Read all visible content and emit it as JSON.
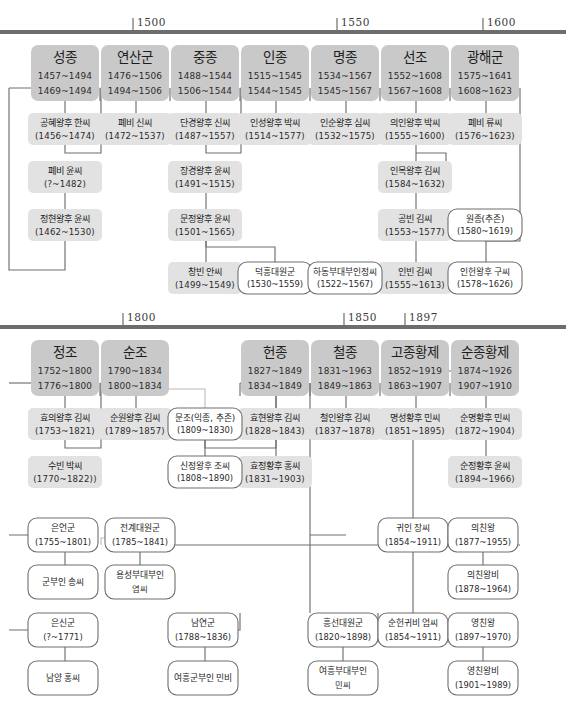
{
  "figure": {
    "colors": {
      "king_box": "#c9c9c9",
      "consort_box": "#e2e2e2",
      "outline_box": "#ffffff",
      "line": "#6f6f6f",
      "line_light": "#b9b9b9",
      "timeline": "#6d6d6d"
    }
  },
  "timelines": [
    {
      "id": "timeline-top",
      "y": 30,
      "x1": 0,
      "x2": 566,
      "ticks": [
        {
          "label": "1500",
          "x": 133
        },
        {
          "label": "1550",
          "x": 337
        },
        {
          "label": "1600",
          "x": 483
        }
      ]
    },
    {
      "id": "timeline-bottom",
      "y": 325,
      "x1": 0,
      "x2": 566,
      "ticks": [
        {
          "label": "1800",
          "x": 123
        },
        {
          "label": "1850",
          "x": 344
        },
        {
          "label": "1897",
          "x": 405
        }
      ]
    }
  ],
  "kings_top": [
    {
      "name": "성종",
      "life": "1457~1494",
      "reign": "1469~1494",
      "x": 31,
      "y": 45
    },
    {
      "name": "연산군",
      "life": "1476~1506",
      "reign": "1494~1506",
      "x": 101,
      "y": 45
    },
    {
      "name": "중종",
      "life": "1488~1544",
      "reign": "1506~1544",
      "x": 171,
      "y": 45
    },
    {
      "name": "인종",
      "life": "1515~1545",
      "reign": "1544~1545",
      "x": 241,
      "y": 45
    },
    {
      "name": "명종",
      "life": "1534~1567",
      "reign": "1545~1567",
      "x": 311,
      "y": 45
    },
    {
      "name": "선조",
      "life": "1552~1608",
      "reign": "1567~1608",
      "x": 381,
      "y": 45
    },
    {
      "name": "광해군",
      "life": "1575~1641",
      "reign": "1608~1623",
      "x": 451,
      "y": 45
    }
  ],
  "kings_bottom": [
    {
      "name": "정조",
      "life": "1752~1800",
      "reign": "1776~1800",
      "x": 31,
      "y": 340
    },
    {
      "name": "순조",
      "life": "1790~1834",
      "reign": "1800~1834",
      "x": 101,
      "y": 340
    },
    {
      "name": "헌종",
      "life": "1827~1849",
      "reign": "1834~1849",
      "x": 241,
      "y": 340
    },
    {
      "name": "철종",
      "life": "1831~1963",
      "reign": "1849~1863",
      "x": 311,
      "y": 340
    },
    {
      "name": "고종황제",
      "life": "1852~1919",
      "reign": "1863~1907",
      "x": 381,
      "y": 340
    },
    {
      "name": "순종황제",
      "life": "1874~1926",
      "reign": "1907~1910",
      "x": 451,
      "y": 340
    }
  ],
  "consorts_top": [
    {
      "name": "공혜왕후 한씨",
      "date": "(1456~1474)",
      "x": 28,
      "y": 113
    },
    {
      "name": "폐비 윤씨",
      "date": "(?~1482)",
      "x": 28,
      "y": 161
    },
    {
      "name": "정현왕후 윤씨",
      "date": "(1462~1530)",
      "x": 28,
      "y": 209
    },
    {
      "name": "폐비 신씨",
      "date": "(1472~1537)",
      "x": 98,
      "y": 113
    },
    {
      "name": "단경왕후 신씨",
      "date": "(1487~1557)",
      "x": 168,
      "y": 113
    },
    {
      "name": "장경왕후 윤씨",
      "date": "(1491~1515)",
      "x": 168,
      "y": 161
    },
    {
      "name": "문정왕후 윤씨",
      "date": "(1501~1565)",
      "x": 168,
      "y": 209
    },
    {
      "name": "창빈 안씨",
      "date": "(1499~1549)",
      "x": 168,
      "y": 262
    },
    {
      "name": "인성왕후 박씨",
      "date": "(1514~1577)",
      "x": 238,
      "y": 113
    },
    {
      "name": "인순왕후 심씨",
      "date": "(1532~1575)",
      "x": 308,
      "y": 113
    },
    {
      "name": "의인왕후 박씨",
      "date": "(1555~1600)",
      "x": 378,
      "y": 113
    },
    {
      "name": "인목왕후 김씨",
      "date": "(1584~1632)",
      "x": 378,
      "y": 161
    },
    {
      "name": "공빈 김씨",
      "date": "(1553~1577)",
      "x": 378,
      "y": 209
    },
    {
      "name": "인빈 김씨",
      "date": "(1555~1613)",
      "x": 378,
      "y": 262
    },
    {
      "name": "폐비 류씨",
      "date": "(1576~1623)",
      "x": 448,
      "y": 113
    }
  ],
  "outline_top": [
    {
      "name": "덕흥대원군",
      "date": "(1530~1559)",
      "x": 238,
      "y": 262,
      "w": 74,
      "h": 32
    },
    {
      "name": "하동부대부인정씨",
      "date": "(1522~1567)",
      "x": 308,
      "y": 262,
      "w": 74,
      "h": 32
    },
    {
      "name": "원종(추존)",
      "date": "(1580~1619)",
      "x": 448,
      "y": 209,
      "w": 74,
      "h": 32
    },
    {
      "name": "인헌왕후 구씨",
      "date": "(1578~1626)",
      "x": 448,
      "y": 262,
      "w": 74,
      "h": 32
    }
  ],
  "consorts_bottom": [
    {
      "name": "효의왕후 김씨",
      "date": "(1753~1821)",
      "x": 28,
      "y": 408
    },
    {
      "name": "수빈 박씨",
      "date": "(1770~1822))",
      "x": 28,
      "y": 456
    },
    {
      "name": "순원왕후 김씨",
      "date": "(1789~1857)",
      "x": 98,
      "y": 408
    },
    {
      "name": "효현왕후 김씨",
      "date": "(1828~1843)",
      "x": 238,
      "y": 408
    },
    {
      "name": "효정황후 홍씨",
      "date": "(1831~1903)",
      "x": 238,
      "y": 456
    },
    {
      "name": "철인왕후 김씨",
      "date": "(1837~1878)",
      "x": 308,
      "y": 408
    },
    {
      "name": "명성황후 민씨",
      "date": "(1851~1895)",
      "x": 378,
      "y": 408
    },
    {
      "name": "순명황후 민씨",
      "date": "(1872~1904)",
      "x": 448,
      "y": 408
    },
    {
      "name": "순정황후 윤씨",
      "date": "(1894~1966)",
      "x": 448,
      "y": 456
    }
  ],
  "outline_bottom": [
    {
      "name": "문조(익종, 추존)",
      "date": "(1809~1830)",
      "x": 168,
      "y": 408,
      "w": 74,
      "h": 32
    },
    {
      "name": "신정왕후 조씨",
      "date": "(1808~1890)",
      "x": 168,
      "y": 456,
      "w": 74,
      "h": 32
    },
    {
      "name": "은언군",
      "date": "(1755~1801)",
      "x": 28,
      "y": 518,
      "w": 70,
      "h": 34
    },
    {
      "name": "전계대원군",
      "date": "(1785~1841)",
      "x": 105,
      "y": 518,
      "w": 70,
      "h": 34
    },
    {
      "name": "군부인 송씨",
      "date": "",
      "x": 28,
      "y": 565,
      "w": 70,
      "h": 34
    },
    {
      "name": "용성부대부인",
      "date": "염씨",
      "x": 105,
      "y": 565,
      "w": 70,
      "h": 34
    },
    {
      "name": "은신군",
      "date": "(?~1771)",
      "x": 28,
      "y": 613,
      "w": 70,
      "h": 34
    },
    {
      "name": "남연군",
      "date": "(1788~1836)",
      "x": 168,
      "y": 613,
      "w": 70,
      "h": 34
    },
    {
      "name": "남양 홍씨",
      "date": "",
      "x": 28,
      "y": 661,
      "w": 70,
      "h": 34
    },
    {
      "name": "여흥군부인 민비",
      "date": "",
      "x": 168,
      "y": 661,
      "w": 70,
      "h": 34
    },
    {
      "name": "흥선대원군",
      "date": "(1820~1898)",
      "x": 308,
      "y": 613,
      "w": 70,
      "h": 34
    },
    {
      "name": "여흥부대부인",
      "date": "민씨",
      "x": 308,
      "y": 661,
      "w": 70,
      "h": 34
    },
    {
      "name": "귀인 장씨",
      "date": "(1854~1911)",
      "x": 378,
      "y": 518,
      "w": 70,
      "h": 34
    },
    {
      "name": "순헌귀비 엄씨",
      "date": "(1854~1911)",
      "x": 378,
      "y": 613,
      "w": 70,
      "h": 34
    },
    {
      "name": "의친왕",
      "date": "(1877~1955)",
      "x": 448,
      "y": 518,
      "w": 70,
      "h": 34
    },
    {
      "name": "의친왕비",
      "date": "(1878~1964)",
      "x": 448,
      "y": 565,
      "w": 70,
      "h": 34
    },
    {
      "name": "영친왕",
      "date": "(1897~1970)",
      "x": 448,
      "y": 613,
      "w": 70,
      "h": 34
    },
    {
      "name": "영친왕비",
      "date": "(1901~1989)",
      "x": 448,
      "y": 661,
      "w": 70,
      "h": 34
    }
  ],
  "edges": {
    "solid": [
      "M65,101 L65,113",
      "M65,145 L65,153 L101,153 L101,88 L136,88 L136,101",
      "M65,193 L65,209",
      "M9,88 L65,88",
      "M9,88 L9,270 L65,270 L65,241",
      "M136,101 L136,113",
      "M206,101 L206,113",
      "M206,145 L206,153 L241,153 L241,88 L276,88 L276,101",
      "M206,193 L206,209",
      "M206,241 L206,255 L206,262",
      "M276,101 L276,113",
      "M346,101 L346,113",
      "M206,241 L206,247 L275,247 L275,262",
      "M416,101 L416,113",
      "M416,145 L416,161",
      "M416,193 L416,209",
      "M416,241 L416,262",
      "M486,101 L486,113",
      "M275,278 L345,278",
      "M486,209 L486,262",
      "M310,88 L310,101",
      "M380,88 L380,101",
      "M450,88 L450,101",
      "M100,88 L100,101",
      "M170,88 L170,101",
      "M240,88 L240,101",
      "M520,88 L520,241 L485,241",
      "M446,193 L446,161 L446,153 L416,153",
      "M65,396 L65,408",
      "M65,440 L65,448 L101,448 L101,383 L136,383 L136,396",
      "M136,396 L136,408",
      "M276,396 L276,408",
      "M276,440 L276,456",
      "M346,396 L346,408",
      "M416,396 L416,408",
      "M486,396 L486,408",
      "M486,440 L486,456",
      "M416,379 L416,371 L486,371 L486,383",
      "M310,383 L310,396",
      "M380,383 L380,396",
      "M450,383 L450,396",
      "M100,383 L100,396",
      "M240,383 L240,396",
      "M9,383 L31,383",
      "M205,440 L205,448 L276,448 L276,383 L240,383",
      "M205,440 L205,456",
      "M65,552 L65,565",
      "M140,552 L140,565",
      "M65,647 L65,661",
      "M205,647 L205,661",
      "M343,647 L343,661",
      "M140,552 L140,545 L520,545",
      "M413,440 L413,518",
      "M413,552 L413,613",
      "M483,552 L483,565",
      "M483,647 L483,661",
      "M310,383 L310,535 L310,613",
      "M346,535 L310,535",
      "M65,535 L9,535",
      "M205,630 L240,630 L240,613",
      "M65,630 L9,630",
      "M343,630 L378,630 L378,613"
    ],
    "light": [
      "M136,396 L136,389 L205,389 L205,408",
      "M448,534 L448,527 L413,527",
      "M448,630 L448,623 L413,623",
      "M416,225 L448,225",
      "M416,270 L448,270",
      "M101,545 L101,538 L140,538"
    ]
  }
}
